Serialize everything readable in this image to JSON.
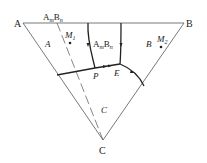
{
  "diagram": {
    "type": "ternary-phase-diagram",
    "vertices": {
      "A": {
        "label": "A",
        "x": 23,
        "y": 23
      },
      "B": {
        "label": "B",
        "x": 184,
        "y": 23
      },
      "C": {
        "label": "C",
        "x": 103,
        "y": 140
      }
    },
    "compound": {
      "label_main": "A",
      "sub_m": "m",
      "label_b": "B",
      "sub_n": "n"
    },
    "fields": {
      "A": "A",
      "B": "B",
      "C": "C",
      "AmBn": {
        "main": "A",
        "sub_m": "m",
        "b": "B",
        "sub_n": "n"
      }
    },
    "points": {
      "M1": {
        "label": "M",
        "sub": "1"
      },
      "M2": {
        "label": "M",
        "sub": "2"
      },
      "P": "P",
      "E": "E"
    }
  }
}
